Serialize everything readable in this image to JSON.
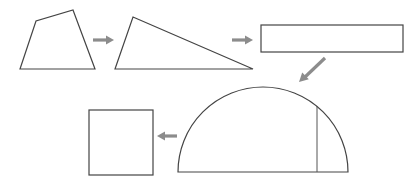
{
  "diagram": {
    "title": "",
    "colors": {
      "outline": "#444444",
      "arrow": "#8c8c8c",
      "background": "#ffffff"
    },
    "steps": [
      {
        "id": "quadrilateral",
        "label": "",
        "shape": "quadrilateral"
      },
      {
        "id": "triangle",
        "label": "",
        "shape": "triangle"
      },
      {
        "id": "rectangle",
        "label": "",
        "shape": "rectangle"
      },
      {
        "id": "semicircle",
        "label": "",
        "shape": "semicircle-with-perpendicular"
      },
      {
        "id": "square",
        "label": "",
        "shape": "square"
      }
    ],
    "arrows": [
      {
        "from": "quadrilateral",
        "to": "triangle",
        "direction": "right"
      },
      {
        "from": "triangle",
        "to": "rectangle",
        "direction": "right"
      },
      {
        "from": "rectangle",
        "to": "semicircle",
        "direction": "down-left"
      },
      {
        "from": "semicircle",
        "to": "square",
        "direction": "left"
      }
    ]
  }
}
